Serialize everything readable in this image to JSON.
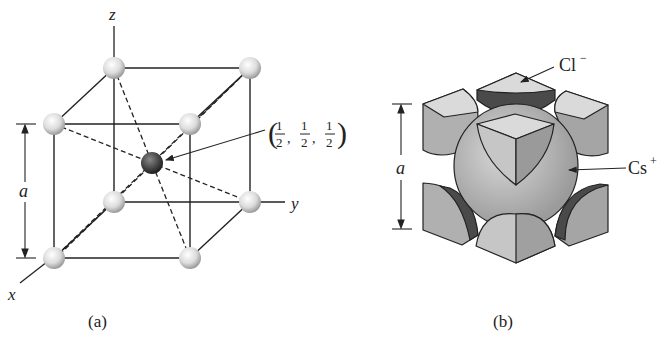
{
  "figure_a": {
    "caption": "(a)",
    "axis_labels": {
      "z": "z",
      "y": "y",
      "x": "x"
    },
    "dimension_label": "a",
    "center_coordinate": {
      "open": "(",
      "frac": "1",
      "den": "2",
      "sep": ",",
      "close": ")"
    },
    "atoms": {
      "corner_color": "#d8d8d8",
      "center_color": "#444444"
    }
  },
  "figure_b": {
    "caption": "(b)",
    "dimension_label": "a",
    "anion_label": "Cl",
    "anion_charge": "−",
    "cation_label": "Cs",
    "cation_charge": "+",
    "colors": {
      "light": "#d6d6d6",
      "mid": "#a9a9a9",
      "dark": "#4a4a4a",
      "sphere": "#b8b8b8"
    }
  }
}
